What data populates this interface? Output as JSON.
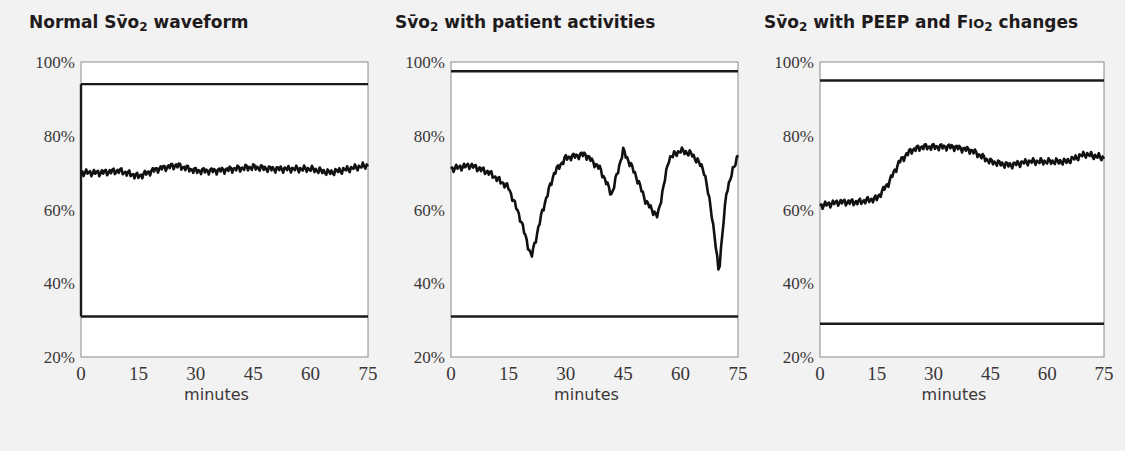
{
  "chart_data": [
    {
      "type": "line",
      "title": "Normal Sv̄o2 waveform",
      "title_main": "Normal Sv̄o",
      "title_sub": "2",
      "title_tail": " waveform",
      "xlabel": "minutes",
      "ylabel": "",
      "xlim": [
        0,
        75
      ],
      "ylim": [
        20,
        100
      ],
      "x_ticks": [
        "0",
        "15",
        "30",
        "45",
        "60",
        "75"
      ],
      "y_ticks": [
        "100%",
        "80%",
        "60%",
        "40%",
        "20%"
      ],
      "reference_lines": [
        94,
        31
      ],
      "grid": false,
      "x": [
        0,
        5,
        10,
        15,
        20,
        25,
        30,
        35,
        40,
        45,
        50,
        55,
        60,
        65,
        70,
        75
      ],
      "values": [
        70,
        70,
        70.5,
        69,
        71,
        72,
        70.5,
        70.5,
        71,
        71.5,
        71,
        71,
        71,
        70,
        71,
        72
      ]
    },
    {
      "type": "line",
      "title": "Sv̄o2 with patient activities",
      "title_main": "Sv̄o",
      "title_sub": "2",
      "title_tail": " with patient activities",
      "xlabel": "minutes",
      "ylabel": "",
      "xlim": [
        0,
        75
      ],
      "ylim": [
        20,
        100
      ],
      "x_ticks": [
        "0",
        "15",
        "30",
        "45",
        "60",
        "75"
      ],
      "y_ticks": [
        "100%",
        "80%",
        "60%",
        "40%",
        "20%"
      ],
      "reference_lines": [
        97.5,
        31
      ],
      "grid": false,
      "x": [
        0,
        5,
        10,
        15,
        18,
        21,
        24,
        27,
        30,
        35,
        39,
        42,
        45,
        48,
        51,
        54,
        57,
        60,
        63,
        66,
        68,
        70,
        72,
        75
      ],
      "values": [
        71,
        72,
        70,
        66,
        58,
        47,
        60,
        70,
        74,
        75,
        71,
        64,
        76,
        70,
        62,
        58,
        74,
        76,
        75,
        71,
        60,
        43,
        65,
        75
      ]
    },
    {
      "type": "line",
      "title": "Sv̄o2 with PEEP and Fio2 changes",
      "title_main": "Sv̄o",
      "title_sub": "2",
      "title_mid": " with PEEP and F",
      "title_mid_small": "IO",
      "title_sub2": "2",
      "title_tail": " changes",
      "xlabel": "minutes",
      "ylabel": "",
      "xlim": [
        0,
        75
      ],
      "ylim": [
        20,
        100
      ],
      "x_ticks": [
        "0",
        "15",
        "30",
        "45",
        "60",
        "75"
      ],
      "y_ticks": [
        "100%",
        "80%",
        "60%",
        "40%",
        "20%"
      ],
      "reference_lines": [
        95,
        29
      ],
      "grid": false,
      "x": [
        0,
        5,
        10,
        15,
        18,
        21,
        24,
        27,
        30,
        35,
        40,
        45,
        50,
        55,
        60,
        65,
        70,
        75
      ],
      "values": [
        61,
        62,
        62,
        63,
        67,
        73,
        76,
        77,
        77,
        77,
        76,
        73,
        72,
        73,
        73,
        73,
        75,
        74
      ]
    }
  ]
}
